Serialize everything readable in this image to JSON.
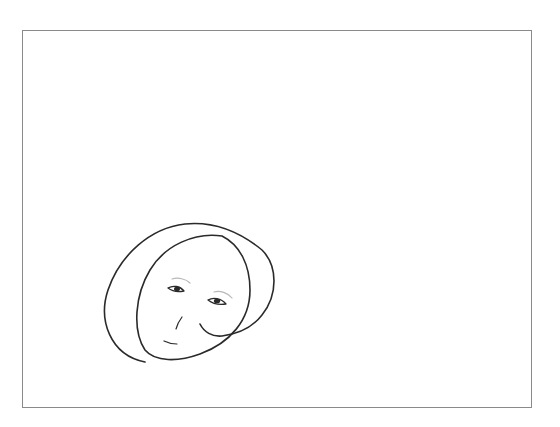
{
  "canvas": {
    "border_color": "#8a8a8a",
    "background": "#ffffff"
  },
  "drawing": {
    "subject": "face-sketch",
    "stroke_color": "#2a2a2a",
    "parts": [
      "hair-outline",
      "face-outline",
      "left-eye",
      "right-eye",
      "left-eyebrow",
      "right-eyebrow",
      "nose",
      "mouth",
      "cheek-curl"
    ]
  }
}
